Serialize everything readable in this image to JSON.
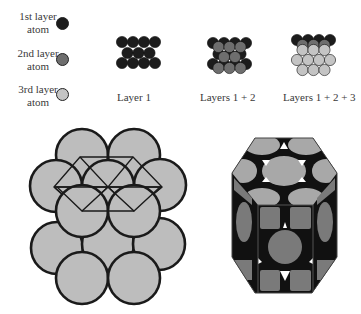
{
  "legend": {
    "items": [
      {
        "label_line1": "1st layer",
        "label_line2": "atom",
        "color": "#1c1c1c"
      },
      {
        "label_line1": "2nd layer",
        "label_line2": "atom",
        "color": "#6e6e6e"
      },
      {
        "label_line1": "3rd layer",
        "label_line2": "atom",
        "color": "#c4c4c4"
      }
    ]
  },
  "stacking": {
    "panels": [
      {
        "caption": "Layer 1"
      },
      {
        "caption": "Layers 1 + 2"
      },
      {
        "caption": "Layers 1 + 2 + 3"
      }
    ]
  },
  "colors": {
    "layer1": "#1c1c1c",
    "layer2": "#6e6e6e",
    "layer3": "#c4c4c4",
    "sphere_fill": "#bdbdbd",
    "outline": "#1a1a1a",
    "prism_face": "#7a7a7a",
    "prism_top": "#a8a8a8"
  },
  "figures": {
    "left": {
      "name": "hcp sphere packing with hexagonal unit outline"
    },
    "right": {
      "name": "hcp hexagonal prism unit cell"
    }
  }
}
